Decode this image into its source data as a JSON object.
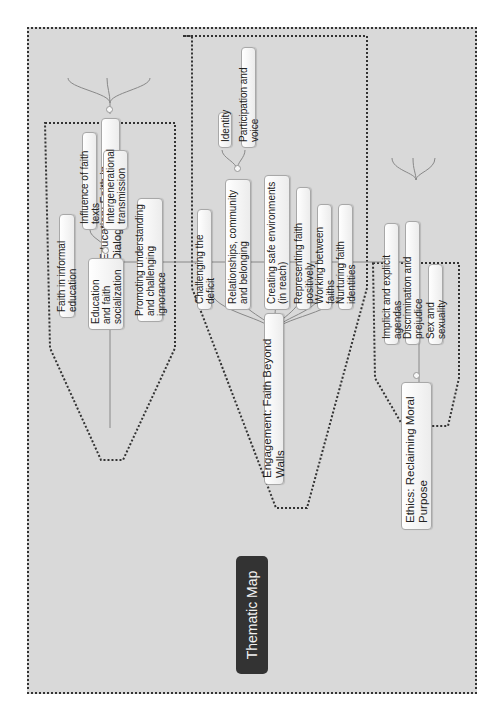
{
  "title": "Thematic Map",
  "branches": [
    {
      "label": "Education: Faith in Dialogue",
      "children": [
        {
          "label": "Faith in informal education"
        },
        {
          "label": "Education and faith socialization",
          "children": [
            {
              "label": "Influence of faith texts"
            },
            {
              "label": "Intergenerational transmission"
            }
          ]
        },
        {
          "label": "Promoting understanding and challenging ignorance"
        }
      ]
    },
    {
      "label": "Engagement: Faith Beyond Walls",
      "children": [
        {
          "label": "Challenging the deficit"
        },
        {
          "label": "Relationships, community and belonging",
          "children": [
            {
              "label": "Identity"
            },
            {
              "label": "Participation and voice"
            }
          ]
        },
        {
          "label": "Creating safe environments (in reach)"
        },
        {
          "label": "Representing faith positively"
        },
        {
          "label": "Working between faiths"
        },
        {
          "label": "Nurturing faith identities"
        }
      ]
    },
    {
      "label": "Ethics: Reclaiming Moral Purpose",
      "children": [
        {
          "label": "Implicit and explicit agendas"
        },
        {
          "label": "Discrimination and prejudice"
        },
        {
          "label": "Sex and sexuality"
        }
      ]
    }
  ],
  "colors": {
    "background": "#d9d9d9",
    "root_fill": "#333333",
    "root_text": "#f2f2f2",
    "connector": "#888888",
    "frame_border": "#333333"
  }
}
